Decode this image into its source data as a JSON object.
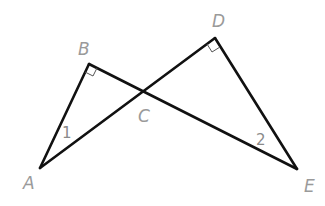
{
  "diagram": {
    "points": {
      "A": {
        "label": "A",
        "x": 40,
        "y": 168
      },
      "B": {
        "label": "B",
        "x": 89,
        "y": 64
      },
      "C": {
        "label": "C",
        "x": 143,
        "y": 90
      },
      "D": {
        "label": "D",
        "x": 215,
        "y": 38
      },
      "E": {
        "label": "E",
        "x": 297,
        "y": 169
      }
    },
    "segments": [
      {
        "from": "A",
        "to": "B"
      },
      {
        "from": "B",
        "to": "E"
      },
      {
        "from": "A",
        "to": "D"
      },
      {
        "from": "D",
        "to": "E"
      }
    ],
    "right_angles": [
      "B",
      "D"
    ],
    "angle_labels": {
      "angle1": "1",
      "angle2": "2"
    },
    "colors": {
      "line": "#111111",
      "label": "#9a9a9a",
      "background": "#ffffff"
    }
  }
}
